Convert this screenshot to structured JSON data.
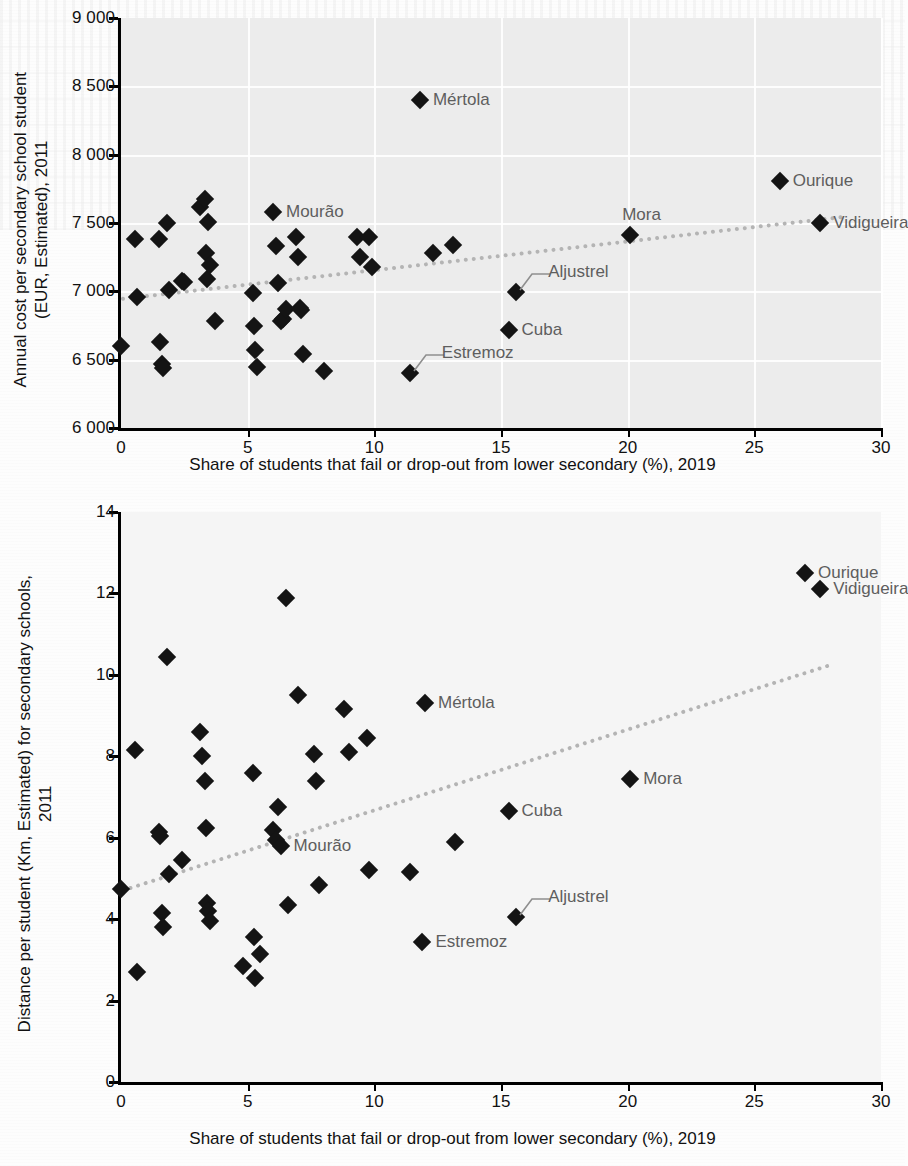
{
  "figure": {
    "panels": [
      {
        "id": "top",
        "ylabel": "Annual cost per secondary school student\n(EUR, Estimated), 2011",
        "xlabel": "Share of students that fail or drop-out from lower secondary (%), 2019"
      },
      {
        "id": "bottom",
        "ylabel": "Distance per student (Km, Estimated) for secondary schools,\n2011",
        "xlabel": "Share of students that fail or drop-out from lower secondary (%), 2019"
      }
    ]
  },
  "chart_data": [
    {
      "type": "scatter",
      "title": "",
      "xlabel": "Share of students that fail or drop-out from lower secondary (%), 2019",
      "ylabel": "Annual cost per secondary school student (EUR, Estimated), 2011",
      "xlim": [
        0,
        30
      ],
      "ylim": [
        6000,
        9000
      ],
      "xticks": [
        0,
        5,
        10,
        15,
        20,
        25,
        30
      ],
      "yticks": [
        6000,
        6500,
        7000,
        7500,
        8000,
        8500,
        9000
      ],
      "xticklabels": [
        "0",
        "5",
        "10",
        "15",
        "20",
        "25",
        "30"
      ],
      "yticklabels": [
        "6 000",
        "6 500",
        "7 000",
        "7 500",
        "8 000",
        "8 500",
        "9 000"
      ],
      "grid": true,
      "legend": false,
      "marker": "diamond",
      "marker_color": "#141414",
      "trendline": {
        "x0": 0,
        "y0": 6960,
        "x1": 28.5,
        "y1": 7560,
        "style": "dotted",
        "color": "#b4b4b4"
      },
      "points": [
        {
          "x": 0.0,
          "y": 6600
        },
        {
          "x": 0.55,
          "y": 7380
        },
        {
          "x": 0.65,
          "y": 6960
        },
        {
          "x": 1.5,
          "y": 7380
        },
        {
          "x": 1.55,
          "y": 6630
        },
        {
          "x": 1.6,
          "y": 6470
        },
        {
          "x": 1.65,
          "y": 6440
        },
        {
          "x": 1.8,
          "y": 7500
        },
        {
          "x": 1.9,
          "y": 7010
        },
        {
          "x": 2.4,
          "y": 7075
        },
        {
          "x": 2.5,
          "y": 7070
        },
        {
          "x": 3.1,
          "y": 7620
        },
        {
          "x": 3.3,
          "y": 7675
        },
        {
          "x": 3.35,
          "y": 7280
        },
        {
          "x": 3.4,
          "y": 7090
        },
        {
          "x": 3.45,
          "y": 7510
        },
        {
          "x": 3.5,
          "y": 7190
        },
        {
          "x": 3.7,
          "y": 6780
        },
        {
          "x": 5.2,
          "y": 6990
        },
        {
          "x": 5.25,
          "y": 6750
        },
        {
          "x": 5.3,
          "y": 6570
        },
        {
          "x": 5.35,
          "y": 6450
        },
        {
          "x": 6.0,
          "y": 7580
        },
        {
          "x": 6.1,
          "y": 7330
        },
        {
          "x": 6.2,
          "y": 7060
        },
        {
          "x": 6.3,
          "y": 6780
        },
        {
          "x": 6.4,
          "y": 6800
        },
        {
          "x": 6.5,
          "y": 6870
        },
        {
          "x": 6.9,
          "y": 7400
        },
        {
          "x": 7.0,
          "y": 7250
        },
        {
          "x": 7.05,
          "y": 6880
        },
        {
          "x": 7.1,
          "y": 6860
        },
        {
          "x": 7.2,
          "y": 6545
        },
        {
          "x": 8.0,
          "y": 6415
        },
        {
          "x": 9.3,
          "y": 7395
        },
        {
          "x": 9.45,
          "y": 7250
        },
        {
          "x": 9.8,
          "y": 7400
        },
        {
          "x": 9.9,
          "y": 7180
        },
        {
          "x": 11.4,
          "y": 6400
        },
        {
          "x": 12.3,
          "y": 7280
        },
        {
          "x": 13.1,
          "y": 7340
        },
        {
          "x": 15.3,
          "y": 6715
        },
        {
          "x": 15.6,
          "y": 6995
        },
        {
          "x": 20.1,
          "y": 7415
        },
        {
          "x": 26.0,
          "y": 7810
        },
        {
          "x": 27.6,
          "y": 7500
        }
      ],
      "annotations": [
        {
          "label": "Mértola",
          "x": 11.8,
          "y": 8400,
          "placement": "right"
        },
        {
          "label": "Mourão",
          "x": 6.0,
          "y": 7580,
          "placement": "right"
        },
        {
          "label": "Mora",
          "x": 20.1,
          "y": 7415,
          "placement": "above"
        },
        {
          "label": "Ourique",
          "x": 26.0,
          "y": 7810,
          "placement": "right"
        },
        {
          "label": "Vidigueira",
          "x": 27.6,
          "y": 7500,
          "placement": "right"
        },
        {
          "label": "Aljustrel",
          "x": 15.6,
          "y": 6995,
          "placement": "leader-right"
        },
        {
          "label": "Cuba",
          "x": 15.3,
          "y": 6715,
          "placement": "right"
        },
        {
          "label": "Estremoz",
          "x": 11.4,
          "y": 6400,
          "placement": "leader-right"
        }
      ]
    },
    {
      "type": "scatter",
      "title": "",
      "xlabel": "Share of students that fail or drop-out from lower secondary (%), 2019",
      "ylabel": "Distance per student (Km, Estimated) for secondary schools, 2011",
      "xlim": [
        0,
        30
      ],
      "ylim": [
        0,
        14
      ],
      "xticks": [
        0,
        5,
        10,
        15,
        20,
        25,
        30
      ],
      "yticks": [
        0,
        2,
        4,
        6,
        8,
        10,
        12,
        14
      ],
      "xticklabels": [
        "0",
        "5",
        "10",
        "15",
        "20",
        "25",
        "30"
      ],
      "yticklabels": [
        "0",
        "2",
        "4",
        "6",
        "8",
        "10",
        "12",
        "14"
      ],
      "grid": false,
      "legend": false,
      "marker": "diamond",
      "marker_color": "#141414",
      "trendline": {
        "x0": 0,
        "y0": 4.75,
        "x1": 28.0,
        "y1": 10.3,
        "style": "dotted",
        "color": "#b4b4b4"
      },
      "points": [
        {
          "x": 0.0,
          "y": 4.75
        },
        {
          "x": 0.55,
          "y": 8.15
        },
        {
          "x": 0.65,
          "y": 2.7
        },
        {
          "x": 1.5,
          "y": 6.15
        },
        {
          "x": 1.55,
          "y": 6.05
        },
        {
          "x": 1.6,
          "y": 4.15
        },
        {
          "x": 1.65,
          "y": 3.8
        },
        {
          "x": 1.8,
          "y": 10.45
        },
        {
          "x": 1.9,
          "y": 5.1
        },
        {
          "x": 2.4,
          "y": 5.45
        },
        {
          "x": 3.1,
          "y": 8.6
        },
        {
          "x": 3.2,
          "y": 8.0
        },
        {
          "x": 3.3,
          "y": 7.4
        },
        {
          "x": 3.35,
          "y": 6.25
        },
        {
          "x": 3.4,
          "y": 4.4
        },
        {
          "x": 3.45,
          "y": 4.2
        },
        {
          "x": 3.5,
          "y": 3.95
        },
        {
          "x": 4.8,
          "y": 2.85
        },
        {
          "x": 5.2,
          "y": 7.6
        },
        {
          "x": 5.25,
          "y": 3.55
        },
        {
          "x": 5.3,
          "y": 2.55
        },
        {
          "x": 5.5,
          "y": 3.15
        },
        {
          "x": 6.0,
          "y": 6.2
        },
        {
          "x": 6.1,
          "y": 5.95
        },
        {
          "x": 6.2,
          "y": 6.75
        },
        {
          "x": 6.3,
          "y": 5.8
        },
        {
          "x": 6.5,
          "y": 11.9
        },
        {
          "x": 6.6,
          "y": 4.35
        },
        {
          "x": 7.0,
          "y": 9.5
        },
        {
          "x": 7.6,
          "y": 8.05
        },
        {
          "x": 7.7,
          "y": 7.4
        },
        {
          "x": 7.8,
          "y": 4.85
        },
        {
          "x": 8.8,
          "y": 9.15
        },
        {
          "x": 9.0,
          "y": 8.1
        },
        {
          "x": 9.7,
          "y": 8.45
        },
        {
          "x": 9.8,
          "y": 5.2
        },
        {
          "x": 11.4,
          "y": 5.15
        },
        {
          "x": 11.9,
          "y": 3.45
        },
        {
          "x": 12.0,
          "y": 9.3
        },
        {
          "x": 13.2,
          "y": 5.9
        },
        {
          "x": 15.3,
          "y": 6.65
        },
        {
          "x": 15.6,
          "y": 4.05
        },
        {
          "x": 20.1,
          "y": 7.45
        },
        {
          "x": 27.0,
          "y": 12.5
        },
        {
          "x": 27.6,
          "y": 12.1
        }
      ],
      "annotations": [
        {
          "label": "Mértola",
          "x": 12.0,
          "y": 9.3,
          "placement": "right"
        },
        {
          "label": "Mourão",
          "x": 6.3,
          "y": 5.8,
          "placement": "right"
        },
        {
          "label": "Mora",
          "x": 20.1,
          "y": 7.45,
          "placement": "right"
        },
        {
          "label": "Ourique",
          "x": 27.0,
          "y": 12.5,
          "placement": "right"
        },
        {
          "label": "Vidigueira",
          "x": 27.6,
          "y": 12.1,
          "placement": "right"
        },
        {
          "label": "Aljustrel",
          "x": 15.6,
          "y": 4.05,
          "placement": "leader-right"
        },
        {
          "label": "Cuba",
          "x": 15.3,
          "y": 6.65,
          "placement": "right"
        },
        {
          "label": "Estremoz",
          "x": 11.9,
          "y": 3.45,
          "placement": "right"
        }
      ]
    }
  ]
}
